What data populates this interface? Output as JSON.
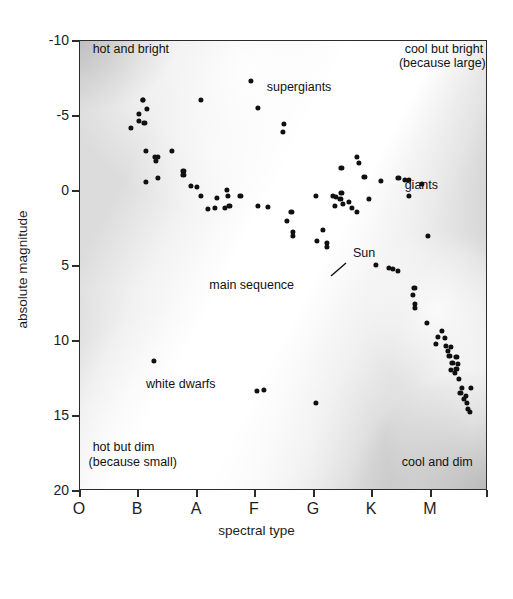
{
  "chart_data": {
    "type": "scatter",
    "title": "",
    "xlabel": "spectral type",
    "ylabel": "absolute magnitude",
    "x_tick_labels": [
      "O",
      "B",
      "A",
      "F",
      "G",
      "K",
      "M"
    ],
    "x_tick_positions": [
      0,
      1,
      2,
      3,
      4,
      5,
      6
    ],
    "y_tick_labels": [
      "-10",
      "-5",
      "0",
      "5",
      "10",
      "15",
      "20"
    ],
    "y_tick_values": [
      -10,
      -5,
      0,
      5,
      10,
      15,
      20
    ],
    "ylim": [
      -10,
      20
    ],
    "y_axis_inverted": true,
    "xlim": [
      -0.1,
      7.0
    ],
    "grid": false,
    "legend": "none",
    "annotations": [
      {
        "name": "hot-and-bright",
        "text": "hot and bright",
        "x": 0.12,
        "y": -9.4
      },
      {
        "name": "cool-but-bright",
        "text": "cool but bright",
        "x": 5.55,
        "y": -9.4
      },
      {
        "name": "because-large",
        "text": "(because large)",
        "x": 5.45,
        "y": -8.45
      },
      {
        "name": "supergiants",
        "text": "supergiants",
        "x": 3.15,
        "y": -6.9
      },
      {
        "name": "giants",
        "text": "giants",
        "x": 5.55,
        "y": -0.35
      },
      {
        "name": "sun",
        "text": "Sun",
        "x": 4.65,
        "y": 4.2
      },
      {
        "name": "main-sequence",
        "text": "main sequence",
        "x": 2.15,
        "y": 6.3
      },
      {
        "name": "white-dwarfs",
        "text": "white dwarfs",
        "x": 1.05,
        "y": 12.9
      },
      {
        "name": "hot-but-dim",
        "text": "hot but dim",
        "x": 0.12,
        "y": 17.1
      },
      {
        "name": "because-small",
        "text": "(because small)",
        "x": 0.05,
        "y": 18.1
      },
      {
        "name": "cool-and-dim",
        "text": "cool and dim",
        "x": 5.5,
        "y": 18.1
      }
    ],
    "series": [
      {
        "name": "supergiants",
        "points": [
          [
            2.88,
            -7.35
          ],
          [
            3.0,
            -5.55
          ],
          [
            3.45,
            -4.45
          ],
          [
            3.43,
            -3.95
          ],
          [
            2.0,
            -6.05
          ],
          [
            1.0,
            -6.1
          ]
        ]
      },
      {
        "name": "main-sequence",
        "points": [
          [
            1.0,
            -6.1
          ],
          [
            1.07,
            -5.5
          ],
          [
            0.93,
            -5.15
          ],
          [
            0.92,
            -4.7
          ],
          [
            1.02,
            -4.55
          ],
          [
            0.78,
            -4.2
          ],
          [
            1.05,
            -2.7
          ],
          [
            1.2,
            -2.3
          ],
          [
            1.25,
            -2.3
          ],
          [
            1.22,
            -2.0
          ],
          [
            1.5,
            -2.65
          ],
          [
            1.7,
            -1.35
          ],
          [
            1.7,
            -1.05
          ],
          [
            1.05,
            -0.6
          ],
          [
            1.25,
            -0.85
          ],
          [
            1.83,
            -0.35
          ],
          [
            1.93,
            -0.3
          ],
          [
            2.0,
            0.35
          ],
          [
            2.28,
            0.45
          ],
          [
            2.46,
            -0.05
          ],
          [
            2.48,
            0.35
          ],
          [
            2.69,
            0.35
          ],
          [
            2.13,
            1.2
          ],
          [
            2.25,
            1.1
          ],
          [
            2.42,
            1.1
          ],
          [
            2.5,
            1.0
          ],
          [
            3.0,
            1.0
          ],
          [
            3.17,
            1.05
          ],
          [
            3.58,
            1.4
          ],
          [
            3.5,
            2.0
          ],
          [
            3.6,
            2.7
          ],
          [
            3.6,
            3.0
          ],
          [
            4.12,
            2.6
          ],
          [
            4.02,
            3.35
          ],
          [
            4.2,
            3.45
          ],
          [
            4.2,
            3.7
          ],
          [
            5.05,
            4.95
          ],
          [
            5.27,
            5.1
          ],
          [
            5.35,
            5.2
          ],
          [
            5.43,
            5.3
          ],
          [
            5.72,
            6.45
          ],
          [
            5.7,
            6.9
          ],
          [
            5.73,
            7.5
          ],
          [
            5.73,
            7.8
          ],
          [
            5.93,
            8.8
          ],
          [
            6.2,
            9.3
          ],
          [
            6.13,
            9.75
          ],
          [
            6.25,
            9.8
          ],
          [
            6.1,
            10.2
          ],
          [
            6.27,
            10.3
          ],
          [
            6.35,
            10.4
          ],
          [
            6.3,
            10.65
          ],
          [
            6.33,
            11.0
          ],
          [
            6.45,
            11.05
          ],
          [
            6.38,
            11.45
          ],
          [
            6.48,
            11.55
          ],
          [
            6.35,
            11.9
          ],
          [
            6.45,
            11.85
          ],
          [
            6.42,
            12.1
          ],
          [
            6.5,
            12.55
          ],
          [
            6.55,
            13.1
          ],
          [
            6.7,
            13.15
          ],
          [
            6.52,
            13.45
          ],
          [
            6.62,
            13.65
          ],
          [
            6.58,
            13.85
          ],
          [
            6.63,
            14.15
          ],
          [
            6.65,
            14.5
          ],
          [
            6.68,
            14.7
          ]
        ]
      },
      {
        "name": "giants",
        "points": [
          [
            4.72,
            -2.25
          ],
          [
            4.75,
            -1.9
          ],
          [
            4.45,
            -1.55
          ],
          [
            4.85,
            -0.95
          ],
          [
            5.13,
            -0.65
          ],
          [
            5.44,
            -0.85
          ],
          [
            5.56,
            -0.75
          ],
          [
            5.62,
            -0.75
          ],
          [
            5.85,
            -0.5
          ],
          [
            4.0,
            0.3
          ],
          [
            4.3,
            0.3
          ],
          [
            4.35,
            0.4
          ],
          [
            4.45,
            0.15
          ],
          [
            4.43,
            0.55
          ],
          [
            4.48,
            0.85
          ],
          [
            4.58,
            0.75
          ],
          [
            4.63,
            1.1
          ],
          [
            4.72,
            1.4
          ],
          [
            4.93,
            0.5
          ],
          [
            5.62,
            0.35
          ],
          [
            4.33,
            1.0
          ],
          [
            5.95,
            3.0
          ]
        ]
      },
      {
        "name": "white-dwarfs",
        "points": [
          [
            1.18,
            11.35
          ],
          [
            2.98,
            13.3
          ],
          [
            3.1,
            13.25
          ],
          [
            4.0,
            14.15
          ]
        ]
      }
    ]
  },
  "axes": {
    "y_title": "absolute magnitude",
    "x_title": "spectral type"
  }
}
